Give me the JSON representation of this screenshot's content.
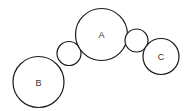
{
  "diagram": {
    "nodes": [
      {
        "id": "A",
        "label": "A",
        "kind": "large"
      },
      {
        "id": "B",
        "label": "B",
        "kind": "large"
      },
      {
        "id": "C",
        "label": "C",
        "kind": "medium"
      },
      {
        "id": "link-BA",
        "label": "",
        "kind": "small"
      },
      {
        "id": "link-AC",
        "label": "",
        "kind": "small"
      }
    ],
    "colors": {
      "stroke": "#1a1a1a",
      "fill": "#ffffff",
      "text": "#333333"
    }
  }
}
